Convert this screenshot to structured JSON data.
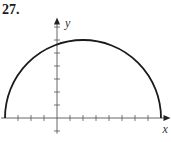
{
  "problem_number": "27.",
  "chart_data": {
    "type": "line",
    "title": "",
    "xlabel": "x",
    "ylabel": "y",
    "equation": "y = sqrt(36 - (x - 2)^2)",
    "x": [
      -4,
      -3,
      -2,
      -1,
      0,
      1,
      2,
      3,
      4,
      5,
      6,
      7,
      8
    ],
    "y": [
      0,
      3.32,
      4.47,
      5.2,
      5.66,
      5.92,
      6,
      5.92,
      5.66,
      5.2,
      4.47,
      3.32,
      0
    ],
    "xlim": [
      -4.3,
      8.5
    ],
    "ylim": [
      -1.2,
      7.5
    ],
    "x_ticks": [
      -3,
      -2,
      -1,
      1,
      2,
      3,
      4,
      5,
      6,
      7
    ],
    "y_ticks": [
      -1,
      1,
      2,
      3,
      4,
      5,
      6,
      7
    ],
    "tick_labels_shown": false,
    "grid": false,
    "legend": null
  },
  "layout": {
    "origin_px": [
      57,
      118
    ],
    "unit_px": 13,
    "curve_color": "#1a1a1a",
    "axis_color": "#555555"
  }
}
